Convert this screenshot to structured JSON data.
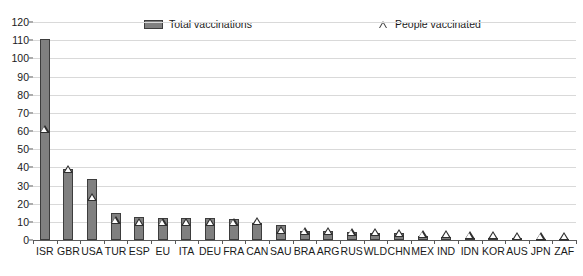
{
  "chart_data": {
    "type": "bar",
    "title": "",
    "subtitle": "",
    "xlabel": "",
    "ylabel": "",
    "ylim": [
      0,
      120
    ],
    "ytick_step": 10,
    "yticks": [
      0,
      10,
      20,
      30,
      40,
      50,
      60,
      70,
      80,
      90,
      100,
      110,
      120
    ],
    "grid": true,
    "legend_position": "top",
    "categories": [
      "ISR",
      "GBR",
      "USA",
      "TUR",
      "ESP",
      "EU",
      "ITA",
      "DEU",
      "FRA",
      "CAN",
      "SAU",
      "BRA",
      "ARG",
      "RUS",
      "WLD",
      "CHN",
      "MEX",
      "IND",
      "IDN",
      "KOR",
      "AUS",
      "JPN",
      "ZAF"
    ],
    "series": [
      {
        "name": "Total vaccinations",
        "marker": "bar",
        "color": "#808080",
        "values": [
          110.5,
          39.3,
          33.8,
          14.6,
          12.6,
          12.1,
          12.0,
          11.9,
          11.6,
          9.6,
          8.1,
          5.2,
          4.7,
          4.2,
          4.1,
          4.0,
          2.1,
          1.6,
          1.3,
          1.1,
          0.9,
          0.7,
          0.5
        ]
      },
      {
        "name": "People vaccinated",
        "marker": "triangle",
        "color": "#2f2f2f",
        "values": [
          59.4,
          37.6,
          22.0,
          9.4,
          8.5,
          8.2,
          8.3,
          8.4,
          8.3,
          8.8,
          3.7,
          3.4,
          3.1,
          2.8,
          2.7,
          2.2,
          1.7,
          1.4,
          1.1,
          0.9,
          0.7,
          0.5,
          0.4
        ]
      }
    ]
  },
  "legend": {
    "total_label": "Total vaccinations",
    "people_label": "People vaccinated"
  },
  "axis": {
    "y_max_label": "120",
    "y_min_label": "0"
  }
}
